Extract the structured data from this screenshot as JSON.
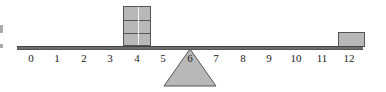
{
  "diagram": {
    "type": "balance-lever",
    "ticks": [
      "0",
      "1",
      "2",
      "3",
      "4",
      "5",
      "6",
      "7",
      "8",
      "9",
      "10",
      "11",
      "12"
    ],
    "fulcrum_position": 6,
    "weights": [
      {
        "position": 4,
        "count": 3
      },
      {
        "position": 12,
        "count": 1
      }
    ],
    "colors": {
      "beam": "#6e6e6e",
      "block": "#b8b8b8",
      "fulcrum": "#b8b8b8",
      "outline": "#555555"
    }
  }
}
